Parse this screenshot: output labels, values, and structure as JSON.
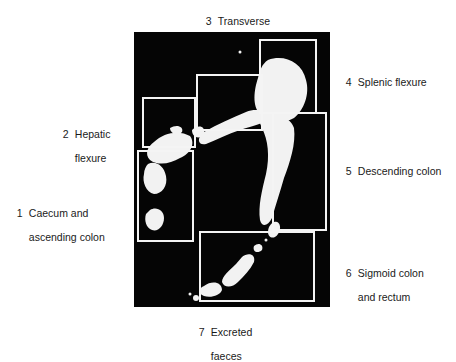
{
  "figure": {
    "background": "#ffffff",
    "panel_color": "#050505",
    "box_color": "#f4f4f4"
  },
  "regions": [
    {
      "number": "1",
      "line1": "Caecum and",
      "line2": "ascending colon"
    },
    {
      "number": "2",
      "line1": "Hepatic",
      "line2": "flexure"
    },
    {
      "number": "3",
      "line1": "Transverse",
      "line2": "colon"
    },
    {
      "number": "4",
      "line1": "Splenic flexure",
      "line2": ""
    },
    {
      "number": "5",
      "line1": "Descending colon",
      "line2": ""
    },
    {
      "number": "6",
      "line1": "Sigmoid colon",
      "line2": "and rectum"
    },
    {
      "number": "7",
      "line1": "Excreted",
      "line2": "faeces"
    }
  ]
}
